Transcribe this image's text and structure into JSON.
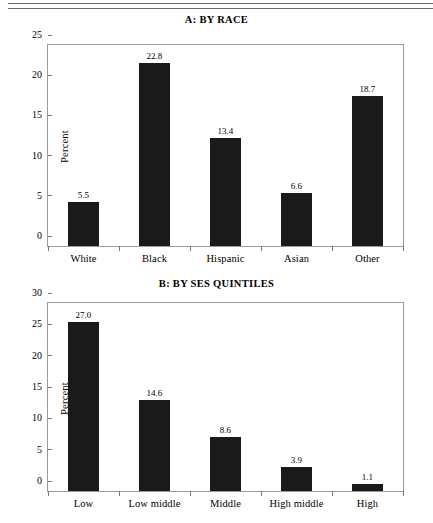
{
  "figure": {
    "rule_color": "#6e6e6e",
    "bar_color": "#1a1a1a",
    "axis_color": "#9a9a9a"
  },
  "chart_data": [
    {
      "type": "bar",
      "panel": "A",
      "title": "A: BY RACE",
      "categories": [
        "White",
        "Black",
        "Hispanic",
        "Asian",
        "Other"
      ],
      "values": [
        5.5,
        22.8,
        13.4,
        6.6,
        18.7
      ],
      "value_labels": [
        "5.5",
        "22.8",
        "13.4",
        "6.6",
        "18.7"
      ],
      "xlabel": "",
      "ylabel": "Percent",
      "ylim": [
        0,
        25
      ],
      "yticks": [
        0,
        5,
        10,
        15,
        20,
        25
      ],
      "ytick_labels": [
        "0",
        "5",
        "10",
        "15",
        "20",
        "25"
      ],
      "grid": false,
      "legend": false
    },
    {
      "type": "bar",
      "panel": "B",
      "title": "B: BY SES QUINTILES",
      "categories": [
        "Low",
        "Low middle",
        "Middle",
        "High middle",
        "High"
      ],
      "values": [
        27.0,
        14.6,
        8.6,
        3.9,
        1.1
      ],
      "value_labels": [
        "27.0",
        "14.6",
        "8.6",
        "3.9",
        "1.1"
      ],
      "xlabel": "",
      "ylabel": "Percent",
      "ylim": [
        0,
        30
      ],
      "yticks": [
        0,
        5,
        10,
        15,
        20,
        25,
        30
      ],
      "ytick_labels": [
        "0",
        "5",
        "10",
        "15",
        "20",
        "25",
        "30"
      ],
      "grid": false,
      "legend": false
    }
  ]
}
